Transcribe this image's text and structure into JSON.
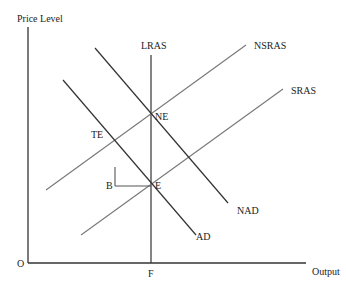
{
  "diagram": {
    "type": "AD-AS macroeconomic diagram",
    "axes": {
      "y_label": "Price Level",
      "x_label": "Output",
      "origin_label": "O",
      "x_mark_label": "F"
    },
    "curves": {
      "lras": "LRAS",
      "nsras": "NSRAS",
      "sras": "SRAS",
      "nad": "NAD",
      "ad": "AD"
    },
    "points": {
      "ne": "NE",
      "te": "TE",
      "b": "B",
      "e": "E"
    },
    "colors": {
      "axis": "#333333",
      "curve": "#444444",
      "supply_curve": "#777777",
      "background": "#ffffff"
    }
  }
}
